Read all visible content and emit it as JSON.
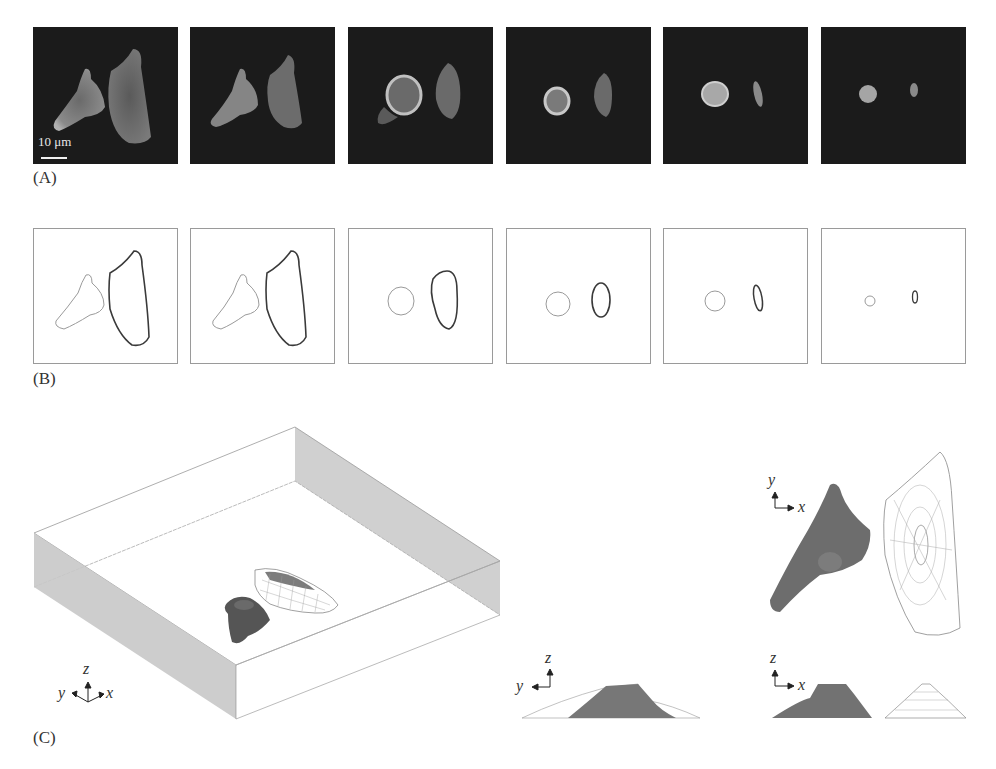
{
  "figure": {
    "panel_labels": {
      "a": "(A)",
      "b": "(B)",
      "c": "(C)"
    },
    "row_a": {
      "description": "Fluorescence microscopy time series of two cells shrinking/rounding",
      "scale_bar": "10 μm",
      "frames": [
        {
          "index": 1,
          "x": 33
        },
        {
          "index": 2,
          "x": 190
        },
        {
          "index": 3,
          "x": 348
        },
        {
          "index": 4,
          "x": 506
        },
        {
          "index": 5,
          "x": 663
        },
        {
          "index": 6,
          "x": 821
        }
      ]
    },
    "row_b": {
      "description": "Segmented cell contours for each frame (left cell light gray, right cell dark)",
      "frames": [
        {
          "index": 1,
          "x": 33
        },
        {
          "index": 2,
          "x": 190
        },
        {
          "index": 3,
          "x": 348
        },
        {
          "index": 4,
          "x": 506
        },
        {
          "index": 5,
          "x": 663
        },
        {
          "index": 6,
          "x": 821
        }
      ]
    },
    "row_c": {
      "description": "3D reconstruction of cells in a box and orthogonal projections",
      "axes": {
        "iso": {
          "x": "x",
          "y": "y",
          "z": "z"
        },
        "top_view": {
          "h": "x",
          "v": "y"
        },
        "side_yz": {
          "h": "y",
          "v": "z"
        },
        "side_xz": {
          "h": "x",
          "v": "z"
        }
      }
    }
  }
}
